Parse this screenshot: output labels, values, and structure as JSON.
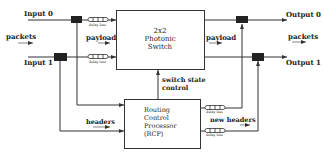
{
  "diagram": {
    "type": "block-diagram",
    "inputs": [
      "Input 0",
      "Input 1"
    ],
    "outputs": [
      "Output 0",
      "Output 1"
    ],
    "left_flow_label": "packets",
    "right_flow_label": "packets",
    "payload_left_label": "payload",
    "payload_right_label": "payload",
    "switch": {
      "line1": "2x2",
      "line2": "Photonic",
      "line3": "Switch"
    },
    "switch_state": {
      "line1": "switch state",
      "line2": "control"
    },
    "headers_label": "headers",
    "new_headers_label": "new headers",
    "rcp": {
      "line1": "Routing",
      "line2": "Control",
      "line3": "Processor",
      "line4": "(RCP)"
    },
    "delay_line_label": "delay line",
    "colors": {
      "line": "#333333",
      "block": "#222222",
      "background": "#ffffff"
    }
  }
}
